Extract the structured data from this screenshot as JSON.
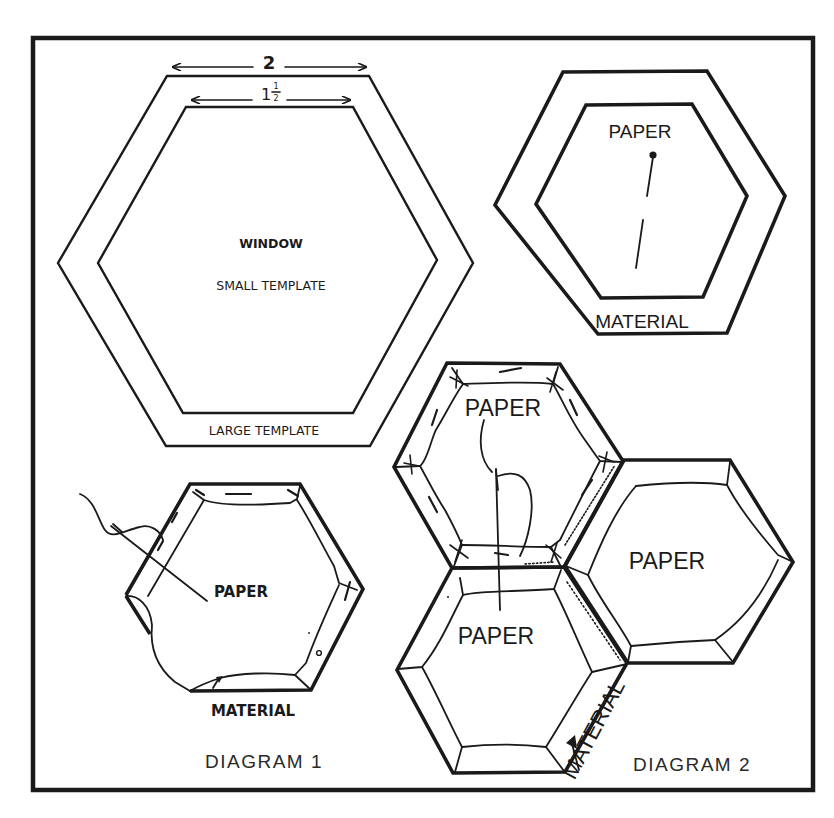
{
  "figure": {
    "colors": {
      "ink": "#1a1a1a",
      "background": "#ffffff"
    }
  },
  "template_diagram": {
    "dimension_outer": "2",
    "dimension_inner_whole": "1",
    "dimension_inner_numerator": "1",
    "dimension_inner_denominator": "2",
    "window_label": "WINDOW",
    "small_template_label": "SMALL TEMPLATE",
    "large_template_label": "LARGE TEMPLATE"
  },
  "pinned_diagram": {
    "paper_label": "PAPER",
    "material_label": "MATERIAL"
  },
  "diagram_1": {
    "paper_label": "PAPER",
    "material_label": "MATERIAL",
    "caption": "DIAGRAM 1"
  },
  "diagram_2": {
    "top_paper_label": "PAPER",
    "right_paper_label": "PAPER",
    "bottom_paper_label": "PAPER",
    "material_label": "MATERIAL",
    "caption": "DIAGRAM 2"
  }
}
